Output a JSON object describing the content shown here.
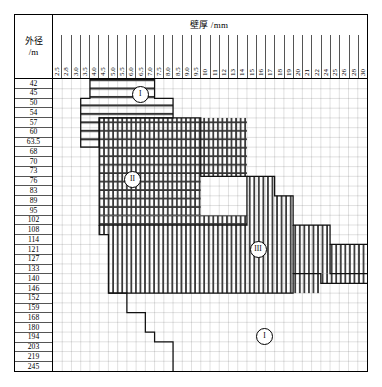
{
  "header": {
    "title": "壁厚 /mm",
    "corner_line1": "外径",
    "corner_line2": "/m"
  },
  "chart_data": {
    "type": "heatmap",
    "title": "壁厚 /mm",
    "xlabel": "壁厚 /mm",
    "ylabel": "外径 /m",
    "grid": true,
    "legend_position": "inline-annotations",
    "categories": [
      "2.5",
      "2.8",
      "3.0",
      "3.5",
      "4.0",
      "4.5",
      "5.0",
      "5.5",
      "6.0",
      "6.5",
      "7.0",
      "7.5",
      "8.0",
      "8.5",
      "9.0",
      "9.5",
      "10",
      "11",
      "12",
      "13",
      "14",
      "15",
      "16",
      "17",
      "18",
      "19",
      "20",
      "21",
      "22",
      "24",
      "25",
      "26",
      "28",
      "30"
    ],
    "rows": [
      "42",
      "45",
      "50",
      "54",
      "57",
      "60",
      "63.5",
      "68",
      "70",
      "73",
      "76",
      "83",
      "89",
      "95",
      "102",
      "108",
      "114",
      "121",
      "127",
      "133",
      "140",
      "146",
      "152",
      "159",
      "168",
      "180",
      "194",
      "203",
      "219",
      "245"
    ],
    "annotations": [
      {
        "label": "I",
        "x_pct": 27.5,
        "y_pct": 5.0,
        "note": "horizontal-hatch region marker"
      },
      {
        "label": "II",
        "x_pct": 25.0,
        "y_pct": 34.0,
        "note": "cross-hatch region marker"
      },
      {
        "label": "III",
        "x_pct": 65.0,
        "y_pct": 58.0,
        "note": "vertical-hatch region marker"
      },
      {
        "label": "I",
        "x_pct": 67.0,
        "y_pct": 88.0,
        "note": "blank region marker"
      }
    ],
    "regions": [
      {
        "name": "I",
        "fill": "horizontal-hatch",
        "description": "upper-left band, thin walls on small diameters"
      },
      {
        "name": "II",
        "fill": "cross-hatch",
        "description": "large central block, mid diameters"
      },
      {
        "name": "III",
        "fill": "vertical-hatch",
        "description": "lower-right block, large diameters"
      },
      {
        "name": "I",
        "fill": "none",
        "description": "lower blank area"
      }
    ],
    "colors": {
      "frame": "#000000",
      "grid": "#555555",
      "boundary": "#111111",
      "hatch": "#333333",
      "background": "#ffffff"
    }
  }
}
